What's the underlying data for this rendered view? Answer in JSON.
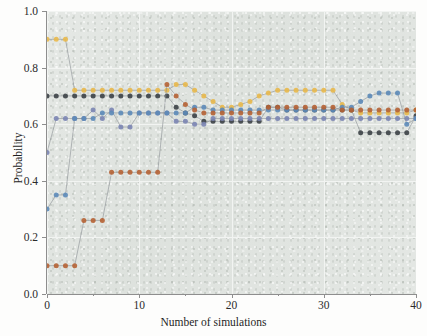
{
  "chart_data": {
    "type": "line",
    "title": "",
    "subtitle": "",
    "xlabel": "Number of simulations",
    "ylabel": "Probability",
    "xlim": [
      0,
      40
    ],
    "ylim": [
      0.0,
      1.0
    ],
    "xticks": [
      0,
      10,
      20,
      30,
      40
    ],
    "xticklabels": [
      "0",
      "10",
      "20",
      "30",
      "40"
    ],
    "yticks": [
      0.0,
      0.2,
      0.4,
      0.6,
      0.8,
      1.0
    ],
    "yticklabels": [
      "0.0",
      "0.2",
      "0.4",
      "0.6",
      "0.8",
      "1.0"
    ],
    "grid": true,
    "grid_color": "#f2f4f2",
    "legend": "none",
    "plot_background": "#dfe3df",
    "marker": "circle",
    "marker_size": 5,
    "x": [
      0,
      1,
      2,
      3,
      4,
      5,
      6,
      7,
      8,
      9,
      10,
      11,
      12,
      13,
      14,
      15,
      16,
      17,
      18,
      19,
      20,
      21,
      22,
      23,
      24,
      25,
      26,
      27,
      28,
      29,
      30,
      31,
      32,
      33,
      34,
      35,
      36,
      37,
      38,
      39,
      40
    ],
    "series": [
      {
        "name": "series-yellow",
        "color": "#e8b84b",
        "values": [
          0.9,
          0.9,
          0.9,
          0.72,
          0.72,
          0.72,
          0.72,
          0.72,
          0.72,
          0.72,
          0.72,
          0.72,
          0.72,
          0.72,
          0.74,
          0.74,
          0.72,
          0.7,
          0.68,
          0.66,
          0.66,
          0.67,
          0.68,
          0.7,
          0.71,
          0.72,
          0.72,
          0.72,
          0.72,
          0.72,
          0.72,
          0.72,
          0.67,
          0.65,
          0.64,
          0.64,
          0.64,
          0.64,
          0.64,
          0.64,
          0.65
        ]
      },
      {
        "name": "series-charcoal",
        "color": "#3c4146",
        "values": [
          0.7,
          0.7,
          0.7,
          0.7,
          0.7,
          0.7,
          0.7,
          0.7,
          0.7,
          0.7,
          0.7,
          0.7,
          0.7,
          0.7,
          0.66,
          0.64,
          0.63,
          0.61,
          0.61,
          0.61,
          0.61,
          0.61,
          0.61,
          0.61,
          0.66,
          0.66,
          0.65,
          0.65,
          0.65,
          0.65,
          0.65,
          0.65,
          0.65,
          0.65,
          0.57,
          0.57,
          0.57,
          0.57,
          0.57,
          0.57,
          0.63
        ]
      },
      {
        "name": "series-slate-blue",
        "color": "#7b85b3",
        "values": [
          0.5,
          0.62,
          0.62,
          0.62,
          0.62,
          0.65,
          0.62,
          0.65,
          0.59,
          0.59,
          0.64,
          0.64,
          0.64,
          0.64,
          0.61,
          0.61,
          0.6,
          0.6,
          0.62,
          0.62,
          0.62,
          0.62,
          0.62,
          0.62,
          0.62,
          0.62,
          0.62,
          0.62,
          0.62,
          0.62,
          0.62,
          0.62,
          0.62,
          0.62,
          0.62,
          0.62,
          0.62,
          0.62,
          0.62,
          0.62,
          0.62
        ]
      },
      {
        "name": "series-steel-blue",
        "color": "#5c89b8",
        "values": [
          0.3,
          0.35,
          0.35,
          0.62,
          0.62,
          0.62,
          0.64,
          0.64,
          0.64,
          0.64,
          0.64,
          0.64,
          0.64,
          0.64,
          0.64,
          0.64,
          0.66,
          0.66,
          0.65,
          0.65,
          0.65,
          0.65,
          0.65,
          0.65,
          0.65,
          0.65,
          0.65,
          0.65,
          0.65,
          0.65,
          0.65,
          0.65,
          0.66,
          0.66,
          0.68,
          0.7,
          0.71,
          0.71,
          0.71,
          0.6,
          0.62
        ]
      },
      {
        "name": "series-rust",
        "color": "#b56234",
        "values": [
          0.1,
          0.1,
          0.1,
          0.1,
          0.26,
          0.26,
          0.26,
          0.43,
          0.43,
          0.43,
          0.43,
          0.43,
          0.43,
          0.74,
          0.7,
          0.67,
          0.65,
          0.64,
          0.64,
          0.64,
          0.64,
          0.64,
          0.64,
          0.64,
          0.66,
          0.66,
          0.66,
          0.66,
          0.66,
          0.66,
          0.66,
          0.66,
          0.65,
          0.65,
          0.65,
          0.65,
          0.65,
          0.65,
          0.65,
          0.65,
          0.65
        ]
      }
    ]
  }
}
